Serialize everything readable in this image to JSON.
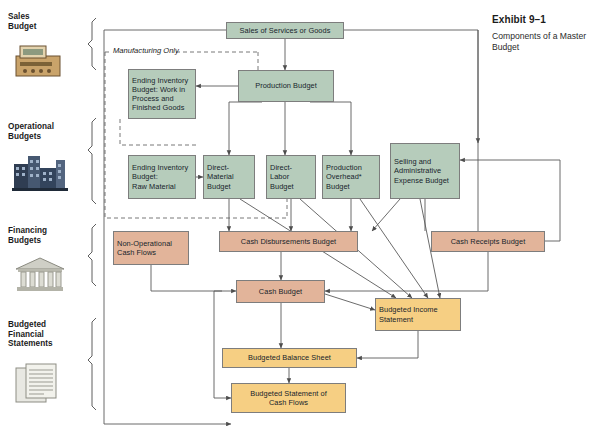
{
  "exhibit": {
    "number": "Exhibit 9–1",
    "title": "Components of a Master Budget"
  },
  "manufacturing_note": "Manufacturing Only",
  "side_labels": [
    {
      "name": "sales-budget",
      "text": "Sales\nBudget",
      "icon": "cash-register-icon"
    },
    {
      "name": "operational-budgets",
      "text": "Operational\nBudgets",
      "icon": "factory-icon"
    },
    {
      "name": "financing-budgets",
      "text": "Financing\nBudgets",
      "icon": "bank-icon"
    },
    {
      "name": "budgeted-financial-statements",
      "text": "Budgeted\nFinancial\nStatements",
      "icon": "documents-icon"
    }
  ],
  "nodes": [
    {
      "id": "sales",
      "label": "Sales of Services or Goods",
      "color": "green",
      "x": 226,
      "y": 22,
      "w": 118,
      "h": 17
    },
    {
      "id": "production",
      "label": "Production Budget",
      "color": "green",
      "x": 238,
      "y": 70,
      "w": 96,
      "h": 32
    },
    {
      "id": "endinv_wip",
      "label": "Ending Inventory\nBudget: Work in\nProcess and\nFinished Goods",
      "color": "green",
      "x": 128,
      "y": 69,
      "w": 68,
      "h": 50
    },
    {
      "id": "endinv_raw",
      "label": "Ending Inventory\nBudget:\nRaw Material",
      "color": "green",
      "x": 128,
      "y": 155,
      "w": 68,
      "h": 44
    },
    {
      "id": "directmat",
      "label": "Direct-\nMaterial\nBudget",
      "color": "green",
      "x": 203,
      "y": 155,
      "w": 52,
      "h": 44
    },
    {
      "id": "directlab",
      "label": "Direct-\nLabor\nBudget",
      "color": "green",
      "x": 266,
      "y": 155,
      "w": 50,
      "h": 44
    },
    {
      "id": "overhead",
      "label": "Production\nOverhead*\nBudget",
      "color": "green",
      "x": 322,
      "y": 155,
      "w": 58,
      "h": 44
    },
    {
      "id": "sga",
      "label": "Selling and\nAdministrative\nExpense Budget",
      "color": "green",
      "x": 390,
      "y": 143,
      "w": 70,
      "h": 56
    },
    {
      "id": "nonop",
      "label": "Non-Operational\nCash Flows",
      "color": "salmon",
      "x": 113,
      "y": 231,
      "w": 76,
      "h": 34
    },
    {
      "id": "disb",
      "label": "Cash Disbursements Budget",
      "color": "salmon",
      "x": 219,
      "y": 231,
      "w": 139,
      "h": 21
    },
    {
      "id": "receipts",
      "label": "Cash Receipts Budget",
      "color": "salmon",
      "x": 431,
      "y": 231,
      "w": 114,
      "h": 21
    },
    {
      "id": "cashbudget",
      "label": "Cash Budget",
      "color": "salmon",
      "x": 236,
      "y": 280,
      "w": 89,
      "h": 23
    },
    {
      "id": "incstmt",
      "label": "Budgeted Income\nStatement",
      "color": "amber",
      "x": 375,
      "y": 298,
      "w": 86,
      "h": 33
    },
    {
      "id": "balsheet",
      "label": "Budgeted Balance Sheet",
      "color": "amber",
      "x": 222,
      "y": 348,
      "w": 135,
      "h": 20
    },
    {
      "id": "cashflow",
      "label": "Budgeted Statement of\nCash Flows",
      "color": "amber",
      "x": 231,
      "y": 383,
      "w": 115,
      "h": 30
    }
  ],
  "colors": {
    "green": "#b6ccbb",
    "salmon": "#e2b49a",
    "amber": "#f6cf83",
    "line": "#5a5a5a",
    "border": "#7d7d7d"
  }
}
